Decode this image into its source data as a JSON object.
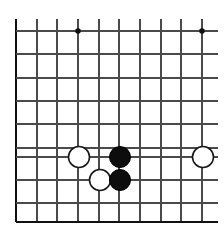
{
  "diagram": {
    "type": "go-board",
    "board": {
      "origin_x": 16,
      "origin_y": 31,
      "spacing_x": 20.6,
      "spacing_y": 23.4,
      "columns": 10,
      "rows": 9,
      "line_color": "#4a4a4a",
      "edge_color": "#111111",
      "background_color": "#ffffff",
      "left_edge_is_board_edge": true,
      "bottom_edge_is_board_edge": true,
      "top_is_cropped": true,
      "right_is_cropped": true,
      "vertical_line_x": [
        16,
        37,
        57,
        78,
        99,
        119,
        140,
        161,
        181,
        202
      ],
      "vertical_line_top_y": 19,
      "vertical_line_bottom_y": 222,
      "horizontal_line_y": [
        31,
        54,
        78,
        101,
        124,
        148,
        157,
        180,
        203,
        222
      ],
      "horizontal_line_left_x": 16,
      "horizontal_line_right_x": 218
    },
    "star_points": [
      {
        "name": "star-point-left",
        "x": 78,
        "y": 31,
        "radius": 2.8
      },
      {
        "name": "star-point-right",
        "x": 202,
        "y": 31,
        "radius": 2.8
      }
    ],
    "stones": [
      {
        "name": "white-stone-left",
        "color": "white",
        "x": 79,
        "y": 157,
        "radius": 10.5
      },
      {
        "name": "black-stone-upper",
        "color": "black",
        "x": 120,
        "y": 157,
        "radius": 10.5
      },
      {
        "name": "white-stone-right-edge",
        "color": "white",
        "x": 203,
        "y": 157,
        "radius": 10.5
      },
      {
        "name": "white-stone-lower",
        "color": "white",
        "x": 100,
        "y": 180,
        "radius": 10.5
      },
      {
        "name": "black-stone-lower",
        "color": "black",
        "x": 120,
        "y": 180,
        "radius": 10.5
      }
    ],
    "colors": {
      "black_stone": "#0d0d0d",
      "white_stone_fill": "#ffffff",
      "white_stone_outline": "#1a1a1a",
      "grid": "#4a4a4a",
      "edge": "#111111"
    }
  }
}
